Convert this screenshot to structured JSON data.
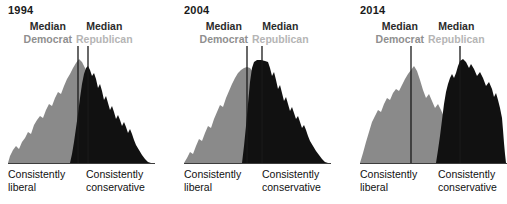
{
  "chart_data": {
    "type": "area",
    "title": "",
    "xlabel": "Ideological consistency",
    "ylabel": "Share of respondents",
    "grid": false,
    "legend_position": "top",
    "axis_left_label": "Consistently\nliberal",
    "axis_right_label": "Consistently\nconservative",
    "series_names": [
      "Democrat",
      "Republican"
    ],
    "colors": {
      "democrat": "#8a8a8a",
      "republican": "#111111",
      "overlap": "#6e6e6e",
      "median_line": "#1a1a1a",
      "baseline": "#3d3d3d",
      "year_text": "#1a1a1a",
      "median_text": "#2b2b2b",
      "democrat_text": "#8f8f8f",
      "republican_text": "#b5b5b5"
    },
    "panels": [
      {
        "year": "1994",
        "median_democrat_x": 70,
        "median_republican_x": 80,
        "democrat_curve": "M0,117 L2,110 L5,104 L8,100 L11,103 L14,96 L17,92 L20,86 L23,88 L26,79 L29,74 L32,70 L35,72 L38,64 L41,58 L44,60 L47,52 L50,46 L53,48 L56,40 L59,33 L62,28 L65,22 L68,17 L71,13 L74,16 L77,22 L80,30 L83,40 L86,52 L89,63 L92,72 L95,80 L98,86 L101,92 L104,97 L107,101 L110,105 L113,108 L116,111 L119,113 L122,115 L126,116 L130,117 L147,117 Z",
        "republican_curve": "M62,117 L64,108 L66,96 L68,82 L70,68 L72,52 L74,38 L76,28 L78,22 L80,20 L82,24 L84,30 L86,27 L88,33 L90,42 L92,38 L94,45 L96,54 L98,50 L100,57 L102,64 L104,60 L106,66 L108,73 L110,69 L112,74 L114,80 L116,76 L118,81 L120,87 L122,83 L124,88 L126,94 L128,99 L131,104 L134,109 L137,113 L140,116 L143,117 Z"
      },
      {
        "year": "2004",
        "median_democrat_x": 63,
        "median_republican_x": 78,
        "democrat_curve": "M0,117 L3,112 L6,106 L9,108 L12,100 L15,93 L18,95 L21,87 L24,80 L27,82 L30,73 L33,66 L36,59 L39,61 L42,52 L45,45 L48,38 L51,32 L54,27 L57,24 L60,22 L63,21 L66,22 L69,26 L72,33 L75,43 L78,55 L81,66 L84,75 L87,83 L90,90 L93,96 L96,101 L99,105 L102,108 L105,111 L109,113 L113,115 L118,116 L124,117 L147,117 Z",
        "republican_curve": "M58,117 L60,100 L62,80 L64,58 L66,36 L68,22 L70,16 L73,14 L77,14 L81,15 L84,16 L86,22 L88,30 L90,26 L92,34 L94,43 L96,39 L98,47 L100,55 L102,51 L104,58 L106,65 L108,61 L110,67 L112,73 L114,70 L116,76 L118,82 L120,79 L122,84 L124,90 L126,95 L129,100 L132,105 L135,109 L138,113 L141,116 L144,117 Z"
      },
      {
        "year": "2014",
        "median_democrat_x": 51,
        "median_republican_x": 100,
        "democrat_curve": "M0,117 L3,107 L6,96 L9,86 L12,76 L15,70 L18,64 L21,66 L24,58 L27,52 L30,54 L33,47 L36,43 L39,45 L42,39 L45,33 L48,28 L51,24 L54,20 L57,25 L60,34 L63,44 L66,52 L69,48 L72,55 L75,62 L78,58 L81,64 L84,71 L87,67 L90,73 L93,80 L96,76 L99,82 L102,88 L105,93 L108,98 L111,102 L114,106 L118,109 L122,112 L127,114 L133,116 L140,117 L147,117 Z",
        "republican_curve": "M76,117 L78,104 L80,90 L82,74 L84,58 L86,46 L88,38 L90,32 L92,28 L94,32 L96,27 L98,20 L100,15 L103,13 L106,16 L109,22 L111,18 L114,23 L117,30 L120,26 L123,32 L126,40 L129,36 L132,43 L134,51 L136,47 L138,54 L140,62 L142,72 L143,84 L144,97 L145,108 L146,117 Z"
      }
    ]
  }
}
